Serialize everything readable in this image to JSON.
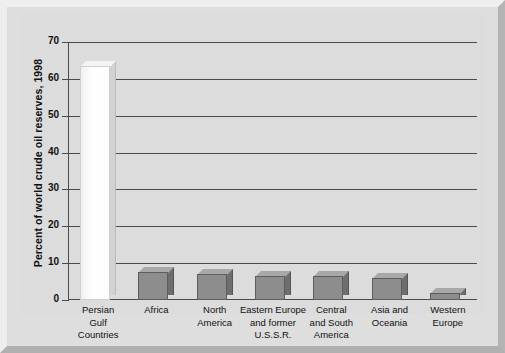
{
  "chart_data": {
    "type": "bar",
    "title": "",
    "xlabel": "",
    "ylabel": "Percent of world crude oil reserves, 1998",
    "ylim": [
      0,
      70
    ],
    "ytick_step": 10,
    "yticks": [
      "70",
      "60",
      "50",
      "40",
      "30",
      "20",
      "10",
      "0"
    ],
    "grid": true,
    "legend": "none",
    "categories": [
      "Persian Gulf Countries",
      "Africa",
      "North America",
      "Eastern Europe and former U.S.S.R.",
      "Central and South America",
      "Asia and Oceania",
      "Western Europe"
    ],
    "category_lines": [
      [
        "Persian",
        "Gulf",
        "Countries"
      ],
      [
        "Africa"
      ],
      [
        "North",
        "America"
      ],
      [
        "Eastern Europe",
        "and former",
        "U.S.S.R."
      ],
      [
        "Central",
        "and South",
        "America"
      ],
      [
        "Asia and",
        "Oceania"
      ],
      [
        "Western",
        "Europe"
      ]
    ],
    "values": [
      63.5,
      7.5,
      7.0,
      6.5,
      6.5,
      6.0,
      1.8
    ],
    "bar_styles": [
      "highlight",
      "normal",
      "normal",
      "normal",
      "normal",
      "normal",
      "normal"
    ]
  },
  "colors": {
    "figure_background": "#d8d8d8",
    "panel_background": "#dedede",
    "plot_background": "#dcdcdc",
    "gridline": "#4a4a4a",
    "bar_face": "#8d8d8d",
    "bar_side": "#6e6e6e",
    "bar_top": "#a8a8a8",
    "highlight_bar_face": "#ffffff",
    "text": "#111111"
  }
}
